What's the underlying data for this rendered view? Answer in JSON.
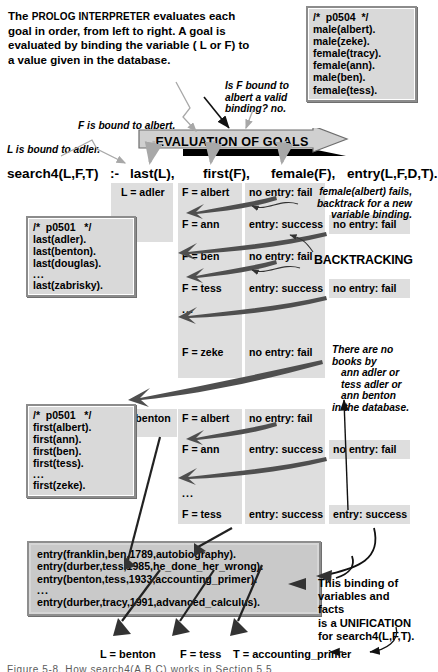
{
  "intro": {
    "line1_pre": "The ",
    "line1_sc": "PROLOG INTERPRETER",
    "line1_post": " evaluates each",
    "line2": "goal in order, from left to right. A goal is",
    "line3": "evaluated by binding the variable ( L or F) to",
    "line4": "a value given in the database."
  },
  "callouts": {
    "f_bound": "F is bound to albert.",
    "l_bound": "L is bound to adler.",
    "is_f_bound": [
      "Is F bound to",
      "albert a valid",
      "binding?  no."
    ],
    "female_fails": [
      "female(albert) fails,",
      "backtrack for a new",
      "variable binding."
    ],
    "backtracking": "BACKTRACKING",
    "no_books": [
      "There are no",
      "books by",
      "ann adler or",
      "tess adler or",
      "ann benton",
      "in the database."
    ],
    "unification": [
      "This binding of",
      "variables and facts",
      "is a UNIFICATION",
      "for search4(L,F,T)."
    ]
  },
  "banner": {
    "label": "EVALUATION OF GOALS"
  },
  "rule": {
    "head": "search4(L,F,T)",
    "neck": ":-",
    "goal1": "last(L),",
    "goal2": "first(F),",
    "goal3": "female(F),",
    "goal4": "entry(L,F,D,T)."
  },
  "boxes": {
    "p0504": {
      "comment": "/*  p0504  */",
      "facts": [
        "male(albert).",
        "male(zeke).",
        "female(tracy).",
        "female(ann).",
        "male(ben).",
        "female(tess)."
      ]
    },
    "last": {
      "comment": "/*  p0501   */",
      "facts": [
        "last(adler).",
        "last(benton).",
        "last(douglas).",
        "...",
        "last(zabrisky)."
      ]
    },
    "first": {
      "comment": "/*  p0501   */",
      "facts": [
        "first(albert).",
        "first(ann).",
        "first(ben).",
        "first(tess).",
        "...",
        "first(zeke)."
      ]
    },
    "database": {
      "facts": [
        "entry(franklin,ben,1789,autobiography).",
        "entry(durber,tess,1985,he_done_her_wrong).",
        "entry(benton,tess,1933,accounting_primer).",
        "...",
        "entry(durber,tracy,1991,advanced_calculus)."
      ]
    }
  },
  "trace": {
    "pass1": {
      "last": "L = adler",
      "rows": [
        {
          "first": "F = albert",
          "female": "no entry: fail",
          "entry": ""
        },
        {
          "first": "F = ann",
          "female": "entry: success",
          "entry": "no entry: fail"
        },
        {
          "first": "F = ben",
          "female": "no entry: fail",
          "entry": ""
        },
        {
          "first": "F = tess",
          "female": "entry: success",
          "entry": "no entry: fail"
        },
        {
          "first": "...",
          "female": "",
          "entry": ""
        },
        {
          "first": "F = zeke",
          "female": "no entry: fail",
          "entry": ""
        }
      ]
    },
    "pass2": {
      "last": "L = benton",
      "rows": [
        {
          "first": "F = albert",
          "female": "no entry: fail",
          "entry": ""
        },
        {
          "first": "F = ann",
          "female": "entry: success",
          "entry": "no entry: fail"
        },
        {
          "first": "...",
          "female": "",
          "entry": ""
        },
        {
          "first": "F = tess",
          "female": "entry: success",
          "entry": "entry: success"
        }
      ]
    }
  },
  "bindings": {
    "l": "L = benton",
    "f": "F = tess",
    "t": "T = accounting_primer"
  },
  "caption": "Figure 5-8.  How search4(A,B,C) works in Section 5.5"
}
